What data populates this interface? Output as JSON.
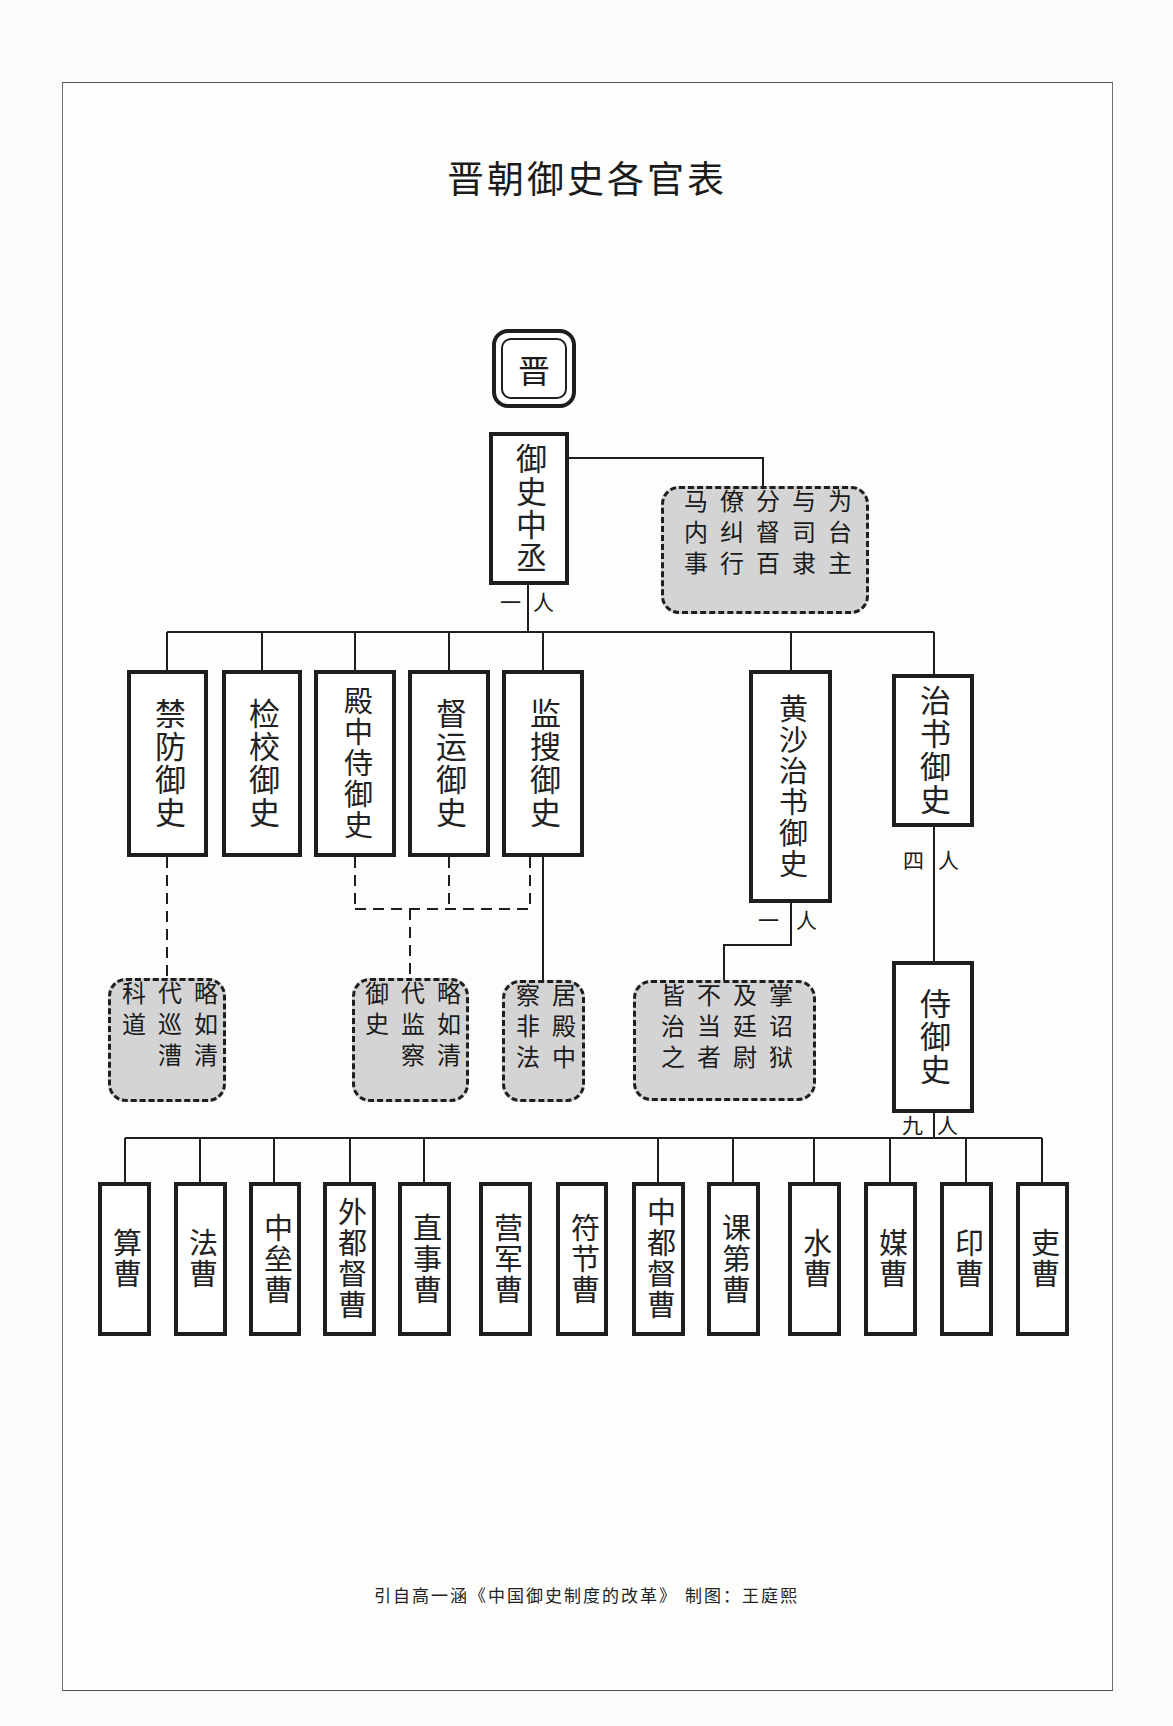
{
  "title": "晋朝御史各官表",
  "root": {
    "label": "晋"
  },
  "head_office": {
    "label": "御史中丞",
    "count": {
      "left": "一",
      "right": "人"
    }
  },
  "head_note": {
    "text": "为台主与司隶分督百僚纠行马内事"
  },
  "level2": [
    {
      "id": "jinfang",
      "label": "禁防御史"
    },
    {
      "id": "jianjiao",
      "label": "检校御史"
    },
    {
      "id": "dianzhong",
      "label": "殿中侍御史"
    },
    {
      "id": "duyun",
      "label": "督运御史"
    },
    {
      "id": "jiansou",
      "label": "监搜御史"
    },
    {
      "id": "huangsha",
      "label": "黄沙治书御史",
      "count": {
        "left": "一",
        "right": "人"
      }
    },
    {
      "id": "zhishu",
      "label": "治书御史",
      "count": {
        "left": "四",
        "right": "人"
      }
    }
  ],
  "notes": [
    {
      "id": "note-jinfang",
      "text": "略如清代巡漕科道"
    },
    {
      "id": "note-dianzhong-group",
      "text": "略如清代监察御史"
    },
    {
      "id": "note-jiansou",
      "text": "居殿中察非法"
    },
    {
      "id": "note-huangsha",
      "text": "掌诏狱及廷尉不当者皆治之"
    }
  ],
  "shiyushi": {
    "label": "侍御史",
    "count": {
      "left": "九",
      "right": "人"
    }
  },
  "level4": [
    {
      "label": "算曹"
    },
    {
      "label": "法曹"
    },
    {
      "label": "中垒曹"
    },
    {
      "label": "外都督曹"
    },
    {
      "label": "直事曹"
    },
    {
      "label": "营军曹"
    },
    {
      "label": "符节曹"
    },
    {
      "label": "中都督曹"
    },
    {
      "label": "课第曹"
    },
    {
      "label": "水曹"
    },
    {
      "label": "媒曹"
    },
    {
      "label": "印曹"
    },
    {
      "label": "吏曹"
    }
  ],
  "footer": "引自高一涵《中国御史制度的改革》 制图：王庭熙",
  "colors": {
    "line": "#1e1e1e",
    "note_fill": "#d4d4d4",
    "box_fill": "#ffffff",
    "page": "#fbfbfa"
  }
}
